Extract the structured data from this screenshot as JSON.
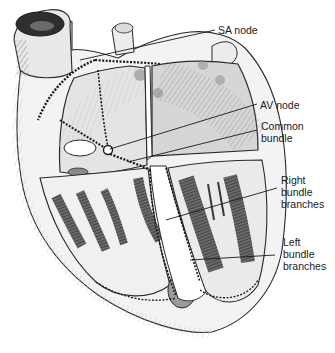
{
  "diagram": {
    "labels": {
      "sa_node": "SA node",
      "av_node": "AV node",
      "common_bundle": "Common\nbundle",
      "right_bundle_branches": "Right\nbundle\nbranches",
      "left_bundle_branches": "Left\nbundle\nbranches"
    }
  }
}
